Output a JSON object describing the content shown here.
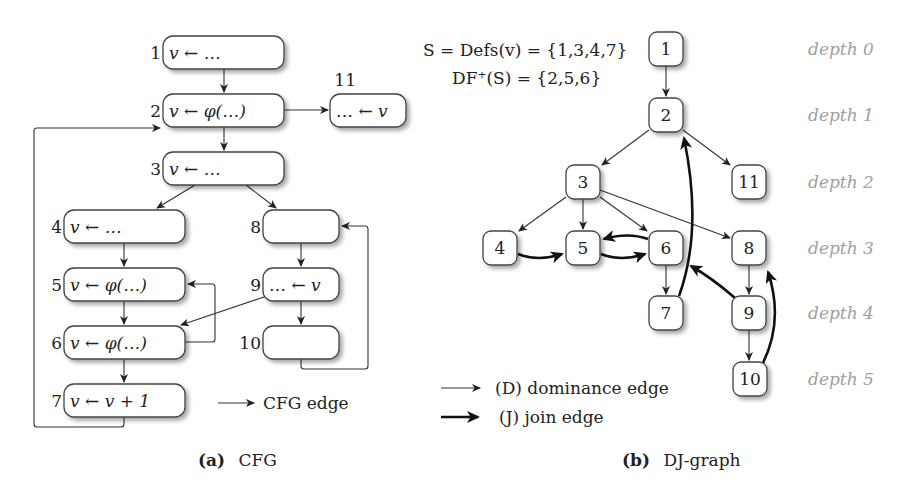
{
  "cfg": {
    "caption_tag": "(a)",
    "caption_text": "CFG",
    "legend": {
      "label": "CFG edge"
    },
    "nodes": [
      {
        "id": "1",
        "label": "1",
        "code": "v ← …",
        "x": 163,
        "y": 36,
        "w": 121,
        "h": 33
      },
      {
        "id": "2",
        "label": "2",
        "code": "v ← φ(…)",
        "x": 163,
        "y": 94,
        "w": 121,
        "h": 33
      },
      {
        "id": "11",
        "label": "11",
        "code": "… ← v",
        "x": 330,
        "y": 94,
        "w": 76,
        "h": 33
      },
      {
        "id": "3",
        "label": "3",
        "code": "v ← …",
        "x": 163,
        "y": 152,
        "w": 121,
        "h": 33
      },
      {
        "id": "4",
        "label": "4",
        "code": "v ← …",
        "x": 64,
        "y": 210,
        "w": 121,
        "h": 33
      },
      {
        "id": "8",
        "label": "8",
        "code": "",
        "x": 263,
        "y": 210,
        "w": 76,
        "h": 33
      },
      {
        "id": "5",
        "label": "5",
        "code": "v ← φ(…)",
        "x": 64,
        "y": 268,
        "w": 121,
        "h": 33
      },
      {
        "id": "9",
        "label": "9",
        "code": "… ← v",
        "x": 263,
        "y": 268,
        "w": 76,
        "h": 33
      },
      {
        "id": "6",
        "label": "6",
        "code": "v ← φ(…)",
        "x": 64,
        "y": 326,
        "w": 121,
        "h": 33
      },
      {
        "id": "10",
        "label": "10",
        "code": "",
        "x": 263,
        "y": 326,
        "w": 76,
        "h": 33
      },
      {
        "id": "7",
        "label": "7",
        "code": "v ← v + 1",
        "x": 64,
        "y": 384,
        "w": 121,
        "h": 33
      }
    ],
    "edges": [
      [
        "1",
        "2"
      ],
      [
        "2",
        "3"
      ],
      [
        "2",
        "11"
      ],
      [
        "3",
        "4"
      ],
      [
        "3",
        "8"
      ],
      [
        "4",
        "5"
      ],
      [
        "5",
        "6"
      ],
      [
        "6",
        "5"
      ],
      [
        "6",
        "7"
      ],
      [
        "7",
        "2"
      ],
      [
        "8",
        "9"
      ],
      [
        "9",
        "6"
      ],
      [
        "9",
        "10"
      ],
      [
        "10",
        "8"
      ]
    ]
  },
  "dj": {
    "caption_tag": "(b)",
    "caption_text": "DJ-graph",
    "formula_line1": "S = Defs(v) = {1,3,4,7}",
    "formula_line2": "DF⁺(S) = {2,5,6}",
    "legend": {
      "dominance": "(D) dominance edge",
      "join": "(J) join edge"
    },
    "depth_labels": [
      "depth 0",
      "depth 1",
      "depth 2",
      "depth 3",
      "depth 4",
      "depth 5"
    ],
    "nodes": [
      {
        "id": "1",
        "label": "1",
        "cx": 666,
        "cy": 49,
        "depth": 0
      },
      {
        "id": "2",
        "label": "2",
        "cx": 666,
        "cy": 115,
        "depth": 1
      },
      {
        "id": "3",
        "label": "3",
        "cx": 583,
        "cy": 182,
        "depth": 2
      },
      {
        "id": "11",
        "label": "11",
        "cx": 749,
        "cy": 182,
        "depth": 2
      },
      {
        "id": "4",
        "label": "4",
        "cx": 500,
        "cy": 248,
        "depth": 3
      },
      {
        "id": "5",
        "label": "5",
        "cx": 583,
        "cy": 248,
        "depth": 3
      },
      {
        "id": "6",
        "label": "6",
        "cx": 666,
        "cy": 248,
        "depth": 3
      },
      {
        "id": "8",
        "label": "8",
        "cx": 749,
        "cy": 248,
        "depth": 3
      },
      {
        "id": "7",
        "label": "7",
        "cx": 666,
        "cy": 313,
        "depth": 4
      },
      {
        "id": "9",
        "label": "9",
        "cx": 749,
        "cy": 313,
        "depth": 4
      },
      {
        "id": "10",
        "label": "10",
        "cx": 750,
        "cy": 379,
        "depth": 5
      }
    ],
    "d_edges": [
      [
        "1",
        "2"
      ],
      [
        "2",
        "3"
      ],
      [
        "2",
        "11"
      ],
      [
        "3",
        "4"
      ],
      [
        "3",
        "5"
      ],
      [
        "3",
        "6"
      ],
      [
        "3",
        "8"
      ],
      [
        "6",
        "7"
      ],
      [
        "8",
        "9"
      ],
      [
        "9",
        "10"
      ]
    ],
    "j_edges": [
      [
        "4",
        "5"
      ],
      [
        "5",
        "6"
      ],
      [
        "6",
        "5"
      ],
      [
        "7",
        "2"
      ],
      [
        "9",
        "6"
      ],
      [
        "10",
        "8"
      ]
    ]
  }
}
